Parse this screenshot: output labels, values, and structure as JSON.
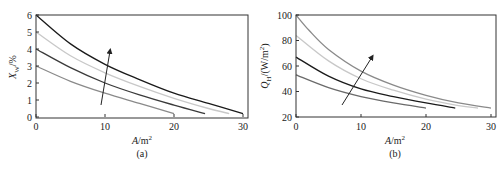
{
  "chart_data": [
    {
      "type": "line",
      "panel": "(a)",
      "title": "",
      "xlabel": "A/m²",
      "ylabel": "X_W/%",
      "xlim": [
        0,
        30.5
      ],
      "ylim": [
        0,
        6
      ],
      "xticks": [
        0,
        10,
        20,
        30
      ],
      "yticks": [
        0,
        1,
        2,
        3,
        4,
        5,
        6
      ],
      "grid": false,
      "legend": "none",
      "annotations": [
        "arrow indicating increasing direction across curves"
      ],
      "series": [
        {
          "name": "curve 1",
          "color": "#1a1a1a",
          "x": [
            0,
            5,
            10,
            15,
            20,
            25,
            30
          ],
          "y": [
            6.0,
            4.3,
            3.1,
            2.2,
            1.4,
            0.8,
            0.2
          ]
        },
        {
          "name": "curve 2",
          "color": "#c8c8c8",
          "x": [
            0,
            5,
            10,
            15,
            20,
            25,
            28
          ],
          "y": [
            5.0,
            3.6,
            2.6,
            1.8,
            1.1,
            0.5,
            0.2
          ]
        },
        {
          "name": "curve 3",
          "color": "#3a3a3a",
          "x": [
            0,
            5,
            10,
            15,
            20,
            24.5
          ],
          "y": [
            4.0,
            2.9,
            2.0,
            1.3,
            0.7,
            0.2
          ]
        },
        {
          "name": "curve 4",
          "color": "#8a8a8a",
          "x": [
            0,
            5,
            10,
            15,
            20
          ],
          "y": [
            3.0,
            2.1,
            1.4,
            0.8,
            0.2
          ]
        }
      ]
    },
    {
      "type": "line",
      "panel": "(b)",
      "title": "",
      "xlabel": "A/m²",
      "ylabel": "Q_H/(W/m²)",
      "xlim": [
        0,
        30.5
      ],
      "ylim": [
        20,
        100
      ],
      "xticks": [
        0,
        10,
        20,
        30
      ],
      "yticks": [
        20,
        40,
        60,
        80,
        100
      ],
      "grid": false,
      "legend": "none",
      "annotations": [
        "arrow indicating increasing direction across curves"
      ],
      "series": [
        {
          "name": "curve 1",
          "color": "#8a8a8a",
          "x": [
            0,
            2,
            5,
            10,
            15,
            20,
            25,
            30
          ],
          "y": [
            103,
            88,
            73,
            56,
            45,
            37,
            31,
            27
          ]
        },
        {
          "name": "curve 2",
          "color": "#c8c8c8",
          "x": [
            0,
            5,
            10,
            15,
            20,
            25,
            28
          ],
          "y": [
            84,
            64,
            50,
            41,
            34,
            29,
            27
          ]
        },
        {
          "name": "curve 3",
          "color": "#1a1a1a",
          "x": [
            0,
            5,
            10,
            15,
            20,
            24.5
          ],
          "y": [
            67,
            52,
            42,
            36,
            31,
            27
          ]
        },
        {
          "name": "curve 4",
          "color": "#6a6a6a",
          "x": [
            0,
            5,
            10,
            15,
            20
          ],
          "y": [
            53,
            43,
            36,
            31,
            27
          ]
        }
      ]
    }
  ],
  "panels": {
    "a": {
      "caption": "(a)",
      "xlabel_main": "A",
      "xlabel_unit": "/m",
      "xlabel_sup": "2",
      "ylabel_main": "X",
      "ylabel_sub": "W",
      "ylabel_unit": "/%",
      "xticks": [
        "0",
        "10",
        "20",
        "30"
      ],
      "yticks": [
        "0",
        "1",
        "2",
        "3",
        "4",
        "5",
        "6"
      ]
    },
    "b": {
      "caption": "(b)",
      "xlabel_main": "A",
      "xlabel_unit": "/m",
      "xlabel_sup": "2",
      "ylabel_main": "Q",
      "ylabel_sub": "H",
      "ylabel_unit": "/(W/m",
      "ylabel_sup": "2",
      "ylabel_close": ")",
      "xticks": [
        "0",
        "10",
        "20",
        "30"
      ],
      "yticks": [
        "20",
        "40",
        "60",
        "80",
        "100"
      ]
    }
  }
}
